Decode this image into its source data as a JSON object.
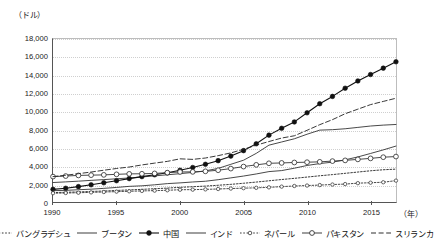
{
  "chart_data": {
    "type": "line",
    "title": "",
    "xlabel": "(年)",
    "ylabel": "（ドル）",
    "xlim": [
      1990,
      2017
    ],
    "ylim": [
      0,
      18000
    ],
    "ytick_step": 2000,
    "grid": true,
    "legend_position": "bottom",
    "x": [
      1990,
      1991,
      1992,
      1993,
      1994,
      1995,
      1996,
      1997,
      1998,
      1999,
      2000,
      2001,
      2002,
      2003,
      2004,
      2005,
      2006,
      2007,
      2008,
      2009,
      2010,
      2011,
      2012,
      2013,
      2014,
      2015,
      2016,
      2017
    ],
    "ytick_labels": [
      "0",
      "2,000",
      "4,000",
      "6,000",
      "8,000",
      "10,000",
      "12,000",
      "14,000",
      "16,000",
      "18,000"
    ],
    "xtick_labels": [
      "1990",
      "1995",
      "2000",
      "2005",
      "2010",
      "2015"
    ],
    "xticks": [
      1990,
      1995,
      2000,
      2005,
      2010,
      2015
    ],
    "series": [
      {
        "name": "バングラデシュ",
        "style": "dotted",
        "marker": "none",
        "color": "#222222",
        "values": [
          1150,
          1180,
          1220,
          1270,
          1320,
          1380,
          1440,
          1500,
          1570,
          1640,
          1720,
          1790,
          1860,
          1950,
          2050,
          2170,
          2300,
          2440,
          2580,
          2710,
          2850,
          2990,
          3120,
          3260,
          3400,
          3540,
          3650,
          3720
        ]
      },
      {
        "name": "ブータン",
        "style": "solid",
        "marker": "none",
        "color": "#333333",
        "values": [
          2250,
          2320,
          2400,
          2490,
          2570,
          2660,
          2750,
          2860,
          2980,
          3100,
          3220,
          3360,
          3530,
          3800,
          4250,
          4700,
          5450,
          6350,
          6700,
          7050,
          7550,
          8000,
          8050,
          8150,
          8300,
          8450,
          8550,
          8620
        ]
      },
      {
        "name": "中国",
        "style": "solid",
        "marker": "filled-circle",
        "color": "#111111",
        "values": [
          1500,
          1620,
          1800,
          2000,
          2220,
          2450,
          2680,
          2900,
          3100,
          3320,
          3600,
          3900,
          4250,
          4650,
          5150,
          5750,
          6500,
          7450,
          8200,
          8900,
          9900,
          10900,
          11700,
          12600,
          13400,
          14100,
          14800,
          15500
        ]
      },
      {
        "name": "インド",
        "style": "solid",
        "marker": "none",
        "color": "#333333",
        "values": [
          1360,
          1390,
          1460,
          1520,
          1610,
          1710,
          1830,
          1890,
          2000,
          2130,
          2210,
          2310,
          2390,
          2560,
          2760,
          2960,
          3190,
          3450,
          3560,
          3820,
          4120,
          4330,
          4490,
          4740,
          5060,
          5440,
          5830,
          6250
        ]
      },
      {
        "name": "ネパール",
        "style": "dotted",
        "marker": "open-circle-small",
        "color": "#333333",
        "values": [
          1080,
          1100,
          1130,
          1170,
          1210,
          1250,
          1290,
          1330,
          1360,
          1400,
          1460,
          1470,
          1500,
          1540,
          1590,
          1630,
          1670,
          1720,
          1800,
          1870,
          1920,
          1970,
          2030,
          2080,
          2180,
          2230,
          2280,
          2460
        ]
      },
      {
        "name": "パキスタン",
        "style": "solid",
        "marker": "open-circle",
        "color": "#333333",
        "values": [
          2900,
          2960,
          3030,
          3060,
          3090,
          3150,
          3200,
          3210,
          3250,
          3330,
          3410,
          3420,
          3480,
          3600,
          3780,
          4000,
          4190,
          4360,
          4400,
          4450,
          4480,
          4520,
          4600,
          4680,
          4790,
          4900,
          5030,
          5100
        ]
      },
      {
        "name": "スリランカ",
        "style": "dashed",
        "marker": "none",
        "color": "#222222",
        "values": [
          2900,
          3050,
          3220,
          3400,
          3600,
          3790,
          3950,
          4180,
          4380,
          4570,
          4850,
          4790,
          4940,
          5200,
          5500,
          5900,
          6350,
          6750,
          7130,
          7380,
          7980,
          8600,
          9150,
          9800,
          10300,
          10800,
          11150,
          11500
        ]
      }
    ]
  },
  "axes": {
    "y_unit_label": "（ドル）",
    "x_unit_label": "（年）"
  }
}
